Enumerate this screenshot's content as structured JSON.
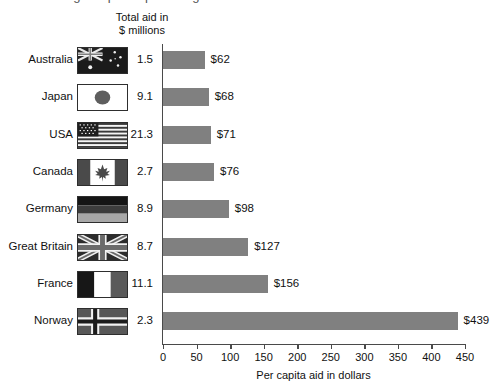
{
  "cropped_title_sliver": "Figure: per capita aid given",
  "column_header": {
    "line1": "Total aid in",
    "line2": "$ millions"
  },
  "chart_data": {
    "type": "bar",
    "orientation": "horizontal",
    "title": "",
    "xlabel": "Per capita aid in dollars",
    "ylabel": "",
    "xlim": [
      0,
      450
    ],
    "xticks": [
      0,
      50,
      100,
      150,
      200,
      250,
      300,
      350,
      400,
      450
    ],
    "xtick_labels": [
      "0",
      "50",
      "100",
      "150",
      "200",
      "250",
      "300",
      "350",
      "400",
      "450"
    ],
    "grid": false,
    "legend": null,
    "bar_color": "#808080",
    "categories": [
      "Australia",
      "Japan",
      "USA",
      "Canada",
      "Germany",
      "Great Britain",
      "France",
      "Norway"
    ],
    "values": [
      62,
      68,
      71,
      76,
      98,
      127,
      156,
      439
    ],
    "value_labels": [
      "$62",
      "$68",
      "$71",
      "$76",
      "$98",
      "$127",
      "$156",
      "$439"
    ],
    "secondary_series": {
      "name": "Total aid in $ millions",
      "values": [
        1.5,
        9.1,
        21.3,
        2.7,
        8.9,
        8.7,
        11.1,
        2.3
      ],
      "value_labels": [
        "1.5",
        "9.1",
        "21.3",
        "2.7",
        "8.9",
        "8.7",
        "11.1",
        "2.3"
      ]
    }
  },
  "rows": [
    {
      "country": "Australia",
      "flag": "flag-australia",
      "aid": "1.5",
      "value": 62,
      "label": "$62"
    },
    {
      "country": "Japan",
      "flag": "flag-japan",
      "aid": "9.1",
      "value": 68,
      "label": "$68"
    },
    {
      "country": "USA",
      "flag": "flag-usa",
      "aid": "21.3",
      "value": 71,
      "label": "$71"
    },
    {
      "country": "Canada",
      "flag": "flag-canada",
      "aid": "2.7",
      "value": 76,
      "label": "$76"
    },
    {
      "country": "Germany",
      "flag": "flag-germany",
      "aid": "8.9",
      "value": 98,
      "label": "$98"
    },
    {
      "country": "Great Britain",
      "flag": "flag-great-britain",
      "aid": "8.7",
      "value": 127,
      "label": "$127"
    },
    {
      "country": "France",
      "flag": "flag-france",
      "aid": "11.1",
      "value": 156,
      "label": "$156"
    },
    {
      "country": "Norway",
      "flag": "flag-norway",
      "aid": "2.3",
      "value": 439,
      "label": "$439"
    }
  ]
}
